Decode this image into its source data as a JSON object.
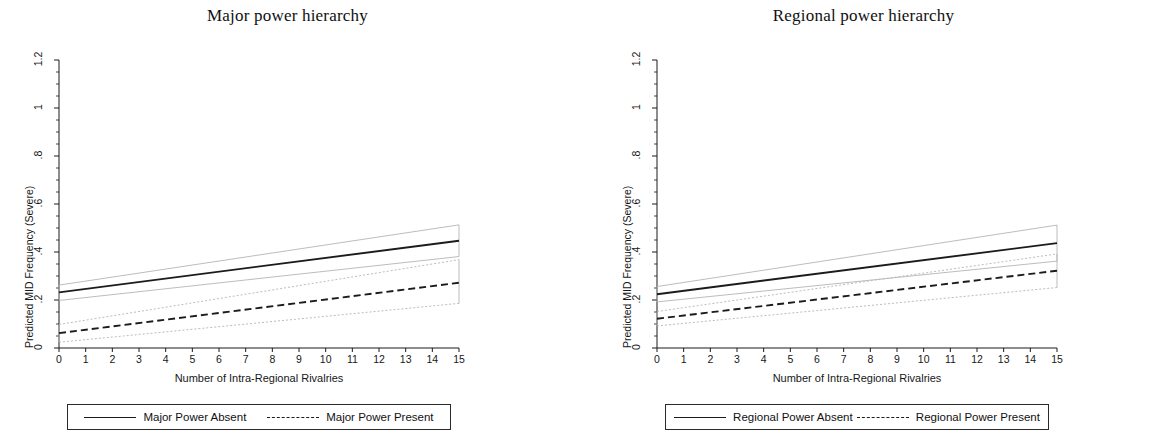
{
  "figure": {
    "width": 1151,
    "height": 434,
    "background": "#ffffff",
    "line_color": "#1b1b1b",
    "ci_color": "#b4b4b4"
  },
  "panels": [
    {
      "id": "major-power-hierarchy",
      "title": "Major power hierarchy",
      "legend": {
        "solid_label": "Major Power Absent",
        "dashed_label": "Major Power Present"
      }
    },
    {
      "id": "regional-power-hierarchy",
      "title": "Regional power hierarchy",
      "legend": {
        "solid_label": "Regional Power Absent",
        "dashed_label": "Regional Power Present"
      }
    }
  ],
  "chart_data": [
    {
      "type": "line",
      "title": "Major power hierarchy",
      "xlabel": "Number of Intra-Regional Rivalries",
      "ylabel": "Predicted MID Frequency (Severe)",
      "xlim": [
        0,
        15
      ],
      "ylim": [
        0,
        1.2
      ],
      "xticks": [
        0,
        1,
        2,
        3,
        4,
        5,
        6,
        7,
        8,
        9,
        10,
        11,
        12,
        13,
        14,
        15
      ],
      "xtick_labels": [
        "0",
        "1",
        "2",
        "3",
        "4",
        "5",
        "6",
        "7",
        "8",
        "9",
        "10",
        "11",
        "12",
        "13",
        "14",
        "15"
      ],
      "yticks": [
        0,
        0.2,
        0.4,
        0.6,
        0.8,
        1,
        1.2
      ],
      "ytick_labels": [
        "0",
        ".2",
        ".4",
        ".6",
        ".8",
        "1",
        "1.2"
      ],
      "minor_yticks": [
        0.05,
        0.1,
        0.15,
        0.25,
        0.3,
        0.35,
        0.45,
        0.5,
        0.55,
        0.65,
        0.7,
        0.75,
        0.85,
        0.9,
        0.95,
        1.05,
        1.1,
        1.15
      ],
      "grid": false,
      "legend_position": "below",
      "x": [
        0,
        15
      ],
      "series": [
        {
          "name": "Major Power Absent",
          "style": "solid",
          "values": [
            0.232,
            0.447
          ],
          "ci_upper": [
            0.262,
            0.513
          ],
          "ci_lower": [
            0.198,
            0.381
          ]
        },
        {
          "name": "Major Power Present",
          "style": "dashed",
          "values": [
            0.062,
            0.272
          ],
          "ci_upper": [
            0.098,
            0.368
          ],
          "ci_lower": [
            0.024,
            0.186
          ]
        }
      ]
    },
    {
      "type": "line",
      "title": "Regional power hierarchy",
      "xlabel": "Number of Intra-Regional Rivalries",
      "ylabel": "Predicted MID Frequency (Severe)",
      "xlim": [
        0,
        15
      ],
      "ylim": [
        0,
        1.2
      ],
      "xticks": [
        0,
        1,
        2,
        3,
        4,
        5,
        6,
        7,
        8,
        9,
        10,
        11,
        12,
        13,
        14,
        15
      ],
      "xtick_labels": [
        "0",
        "1",
        "2",
        "3",
        "4",
        "5",
        "6",
        "7",
        "8",
        "9",
        "10",
        "11",
        "12",
        "13",
        "14",
        "15"
      ],
      "yticks": [
        0,
        0.2,
        0.4,
        0.6,
        0.8,
        1,
        1.2
      ],
      "ytick_labels": [
        "0",
        ".2",
        ".4",
        ".6",
        ".8",
        "1",
        "1.2"
      ],
      "minor_yticks": [
        0.05,
        0.1,
        0.15,
        0.25,
        0.3,
        0.35,
        0.45,
        0.5,
        0.55,
        0.65,
        0.7,
        0.75,
        0.85,
        0.9,
        0.95,
        1.05,
        1.1,
        1.15
      ],
      "grid": false,
      "legend_position": "below",
      "x": [
        0,
        15
      ],
      "series": [
        {
          "name": "Regional Power Absent",
          "style": "solid",
          "values": [
            0.224,
            0.437
          ],
          "ci_upper": [
            0.256,
            0.512
          ],
          "ci_lower": [
            0.192,
            0.362
          ]
        },
        {
          "name": "Regional Power Present",
          "style": "dashed",
          "values": [
            0.122,
            0.322
          ],
          "ci_upper": [
            0.152,
            0.392
          ],
          "ci_lower": [
            0.092,
            0.252
          ]
        }
      ]
    }
  ]
}
